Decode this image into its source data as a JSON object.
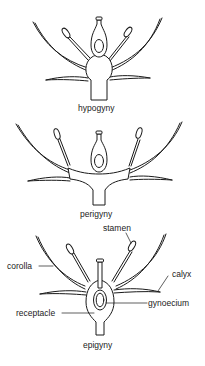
{
  "figure": {
    "colors": {
      "line": "#1a1a1a",
      "text": "#222222",
      "background": "#ffffff"
    },
    "panels": [
      {
        "id": "hypogyny",
        "caption": "hypogyny"
      },
      {
        "id": "perigyny",
        "caption": "perigyny"
      },
      {
        "id": "epigyny",
        "caption": "epigyny",
        "labels": {
          "stamen": "stamen",
          "corolla": "corolla",
          "calyx": "calyx",
          "gynoecium": "gynoecium",
          "receptacle": "receptacle"
        }
      }
    ]
  }
}
